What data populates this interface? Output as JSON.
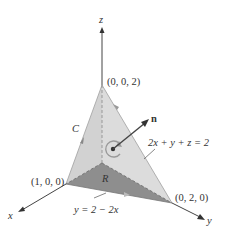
{
  "diagram": {
    "type": "3d-surface-diagram",
    "axes": {
      "x": "x",
      "y": "y",
      "z": "z"
    },
    "points": {
      "z_intercept": "(0, 0, 2)",
      "x_intercept": "(1, 0, 0)",
      "y_intercept": "(0, 2, 0)"
    },
    "labels": {
      "curve": "C",
      "region": "R",
      "normal": "n",
      "plane_equation": "2x + y + z = 2",
      "boundary_line": "y = 2 − 2x"
    },
    "colors": {
      "plane_fill": "#d4d4d4",
      "region_fill": "#8e8e8e",
      "axis": "#444444",
      "edge": "#9a9a9a"
    }
  }
}
